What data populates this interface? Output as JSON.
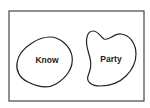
{
  "diagram": {
    "type": "venn",
    "universe": {
      "label": ""
    },
    "sets": [
      {
        "id": "know",
        "label": "Know"
      },
      {
        "id": "party",
        "label": "Party"
      }
    ],
    "relationship": "disjoint"
  },
  "colors": {
    "stroke": "#222222",
    "background": "#ffffff"
  }
}
